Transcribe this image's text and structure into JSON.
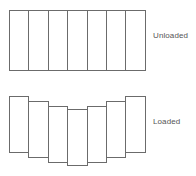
{
  "figure": {
    "type": "diagram",
    "background_color": "#ffffff",
    "stroke_color": "#6b6b6b",
    "fill_color": "#ffffff",
    "label_color": "#555555",
    "segment_count": 7,
    "panels": [
      {
        "id": "unloaded",
        "label": "Unloaded",
        "description": "Seven equal rectangular segments aligned flush in a straight horizontal row forming one continuous rectangle.",
        "segments": [
          {
            "index": 1,
            "x": 9,
            "y": 10,
            "width": 19.4,
            "height": 61,
            "vertical_offset": 0
          },
          {
            "index": 2,
            "x": 28.4,
            "y": 10,
            "width": 19.4,
            "height": 61,
            "vertical_offset": 0
          },
          {
            "index": 3,
            "x": 47.8,
            "y": 10,
            "width": 19.4,
            "height": 61,
            "vertical_offset": 0
          },
          {
            "index": 4,
            "x": 67.2,
            "y": 10,
            "width": 19.4,
            "height": 61,
            "vertical_offset": 0
          },
          {
            "index": 5,
            "x": 86.6,
            "y": 10,
            "width": 19.4,
            "height": 61,
            "vertical_offset": 0
          },
          {
            "index": 6,
            "x": 106.0,
            "y": 10,
            "width": 19.4,
            "height": 61,
            "vertical_offset": 0
          },
          {
            "index": 7,
            "x": 125.4,
            "y": 10,
            "width": 19.4,
            "height": 61,
            "vertical_offset": 0
          }
        ]
      },
      {
        "id": "loaded",
        "label": "Loaded",
        "description": "The same seven segments displaced downward toward the centre, forming a symmetric sagging arch; the central segment sits lowest and the two end segments sit highest.",
        "segments": [
          {
            "index": 1,
            "x": 9,
            "y": 96,
            "width": 19.4,
            "height": 57,
            "vertical_offset": 0
          },
          {
            "index": 2,
            "x": 28.4,
            "y": 101,
            "width": 19.4,
            "height": 57,
            "vertical_offset": 5
          },
          {
            "index": 3,
            "x": 47.8,
            "y": 106,
            "width": 19.4,
            "height": 57,
            "vertical_offset": 10
          },
          {
            "index": 4,
            "x": 67.2,
            "y": 109,
            "width": 19.4,
            "height": 57,
            "vertical_offset": 13
          },
          {
            "index": 5,
            "x": 86.6,
            "y": 106,
            "width": 19.4,
            "height": 57,
            "vertical_offset": 10
          },
          {
            "index": 6,
            "x": 106.0,
            "y": 101,
            "width": 19.4,
            "height": 57,
            "vertical_offset": 5
          },
          {
            "index": 7,
            "x": 125.4,
            "y": 96,
            "width": 19.4,
            "height": 57,
            "vertical_offset": 0
          }
        ]
      }
    ]
  }
}
